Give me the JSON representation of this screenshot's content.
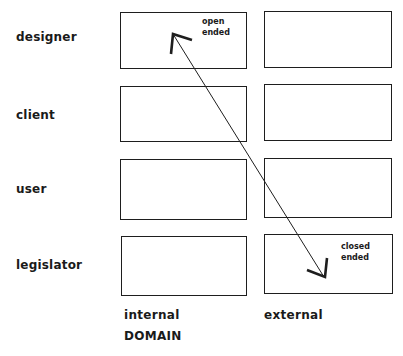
{
  "rows": [
    {
      "label": "designer"
    },
    {
      "label": "client"
    },
    {
      "label": "user"
    },
    {
      "label": "legislator"
    }
  ],
  "columns": [
    {
      "label": "internal"
    },
    {
      "label": "external"
    }
  ],
  "axis_title": "DOMAIN",
  "annotations": {
    "open": {
      "line1": "open",
      "line2": "ended"
    },
    "closed": {
      "line1": "closed",
      "line2": "ended"
    }
  },
  "arrow": {
    "description": "double-headed arrow from designer/internal (open ended) to legislator/external (closed ended)",
    "color": "#1e1e1e"
  }
}
